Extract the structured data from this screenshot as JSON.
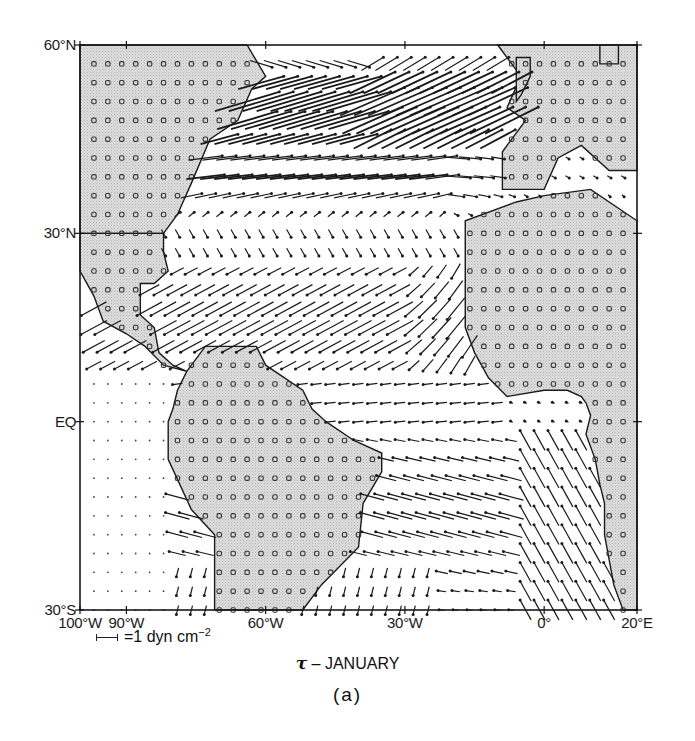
{
  "figure": {
    "title_symbol": "τ",
    "title_text": "– JANUARY",
    "panel_label": "(a)",
    "scale_label": "=1 dyn cm",
    "scale_exponent": "−2"
  },
  "axes": {
    "lat_labels": [
      {
        "text": "60°N",
        "lat": 60
      },
      {
        "text": "30°N",
        "lat": 30
      },
      {
        "text": "EQ",
        "lat": 0
      },
      {
        "text": "30°S",
        "lat": -30
      }
    ],
    "lon_labels": [
      {
        "text": "100°W",
        "lon": -100
      },
      {
        "text": "90°W",
        "lon": -90
      },
      {
        "text": "60°W",
        "lon": -60
      },
      {
        "text": "30°W",
        "lon": -30
      },
      {
        "text": "0°",
        "lon": 0
      },
      {
        "text": "20°E",
        "lon": 20
      }
    ],
    "lon_range": [
      -100,
      20
    ],
    "lat_range": [
      -30,
      60
    ],
    "grid_step_deg": 3
  },
  "colors": {
    "land_fill": "#d9d9d9",
    "land_stipple": "#bdbdbd",
    "frame": "#1a1a1a",
    "vector": "#1a1a1a"
  },
  "map_data": {
    "type": "vector-field",
    "variable": "wind stress τ",
    "month": "January",
    "units": "dyn cm^-2",
    "region": "Tropical and North Atlantic, 100°W–20°E, 30°S–60°N",
    "land": {
      "north_america": [
        [
          -100,
          60
        ],
        [
          -64,
          60
        ],
        [
          -60,
          55
        ],
        [
          -63,
          53
        ],
        [
          -66,
          48
        ],
        [
          -72,
          45
        ],
        [
          -76,
          38
        ],
        [
          -79,
          33
        ],
        [
          -82,
          30
        ],
        [
          -100,
          30
        ]
      ],
      "central_america": [
        [
          -100,
          30
        ],
        [
          -82,
          30
        ],
        [
          -82,
          27
        ],
        [
          -81,
          24
        ],
        [
          -84,
          22
        ],
        [
          -87,
          22
        ],
        [
          -87,
          20
        ],
        [
          -87,
          17
        ],
        [
          -84,
          15
        ],
        [
          -83,
          11
        ],
        [
          -80,
          9
        ],
        [
          -77,
          8
        ],
        [
          -82,
          9
        ],
        [
          -86,
          12
        ],
        [
          -90,
          14
        ],
        [
          -95,
          16
        ],
        [
          -97,
          20
        ],
        [
          -100,
          24
        ]
      ],
      "south_america": [
        [
          -77,
          8
        ],
        [
          -73,
          12
        ],
        [
          -62,
          12
        ],
        [
          -60,
          9
        ],
        [
          -52,
          5
        ],
        [
          -50,
          2
        ],
        [
          -47,
          0
        ],
        [
          -41,
          -3
        ],
        [
          -35,
          -5
        ],
        [
          -35,
          -8
        ],
        [
          -39,
          -13
        ],
        [
          -40,
          -20
        ],
        [
          -48,
          -26
        ],
        [
          -52,
          -30
        ],
        [
          -71,
          -30
        ],
        [
          -71,
          -18
        ],
        [
          -76,
          -14
        ],
        [
          -81,
          -6
        ],
        [
          -81,
          0
        ],
        [
          -80,
          2
        ],
        [
          -79,
          5
        ]
      ],
      "europe": [
        [
          -10,
          60
        ],
        [
          -5,
          55
        ],
        [
          -8,
          50
        ],
        [
          -4,
          48
        ],
        [
          -9,
          43
        ],
        [
          -9,
          37
        ],
        [
          0,
          37
        ],
        [
          3,
          42
        ],
        [
          8,
          44
        ],
        [
          14,
          40
        ],
        [
          20,
          40
        ],
        [
          20,
          60
        ]
      ],
      "africa": [
        [
          -17,
          32
        ],
        [
          -17,
          28
        ],
        [
          -17,
          21
        ],
        [
          -17,
          15
        ],
        [
          -15,
          11
        ],
        [
          -12,
          7
        ],
        [
          -8,
          4
        ],
        [
          0,
          5
        ],
        [
          5,
          5
        ],
        [
          8,
          4
        ],
        [
          9,
          3
        ],
        [
          10,
          1
        ],
        [
          9,
          -2
        ],
        [
          11,
          -6
        ],
        [
          12,
          -10
        ],
        [
          13,
          -13
        ],
        [
          13,
          -18
        ],
        [
          15,
          -26
        ],
        [
          17,
          -30
        ],
        [
          20,
          -30
        ],
        [
          20,
          32
        ],
        [
          10,
          37
        ],
        [
          0,
          36
        ],
        [
          -6,
          35
        ]
      ],
      "iceland_patch": [
        [
          12,
          60
        ],
        [
          16,
          60
        ],
        [
          16,
          57
        ],
        [
          12,
          57
        ]
      ],
      "uk_patch": [
        [
          -6,
          58
        ],
        [
          -3,
          58
        ],
        [
          -3,
          55
        ],
        [
          -5,
          52
        ],
        [
          -6,
          51
        ],
        [
          -6,
          58
        ]
      ]
    },
    "vector_field_summary": [
      {
        "zone": "45–57°N",
        "description": "strong westerlies, vectors up to ~3 dyn cm^-2 directed east/northeast"
      },
      {
        "zone": "36–42°N",
        "description": "moderate eastward, weakening toward Europe"
      },
      {
        "zone": "27–30°N",
        "description": "weak, southeastward/southward"
      },
      {
        "zone": "8–27°N",
        "description": "NE trades ~1 dyn cm^-2 directed southwest"
      },
      {
        "zone": "0–8°N",
        "description": "weak easterlies/westward"
      },
      {
        "zone": "0–30°S",
        "description": "SE trades directed west-northwest; southerlies along African coast"
      },
      {
        "zone": "Pacific west of Central/South America",
        "description": "weak, near zero (dots)"
      }
    ]
  }
}
